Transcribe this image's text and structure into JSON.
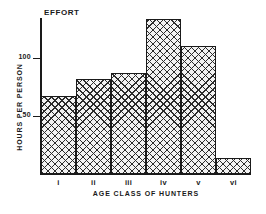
{
  "chart_data": {
    "type": "bar",
    "title": "EFFORT",
    "xlabel": "AGE CLASS OF HUNTERS",
    "ylabel": "HOURS PER PERSON",
    "categories": [
      "i",
      "ii",
      "iii",
      "iv",
      "v",
      "vi"
    ],
    "values": [
      67,
      82,
      87,
      134,
      110,
      14
    ],
    "series": [
      {
        "name": "EFFORT",
        "values": [
          67,
          82,
          87,
          134,
          110,
          14
        ]
      }
    ],
    "ylim": [
      0,
      138
    ],
    "yticks": [
      50,
      100
    ],
    "ytick_labels": [
      "50",
      "100"
    ],
    "grid": false,
    "legend": false,
    "legend_position": "none",
    "bar_fill": "cross-hatch",
    "colors": {
      "axis": "#1a1a1a",
      "bar_edge": "#1a1a1a",
      "bar_hatch": "#2b2b2b",
      "bar_background": "#f2f2f2",
      "page_background": "#ffffff"
    }
  }
}
